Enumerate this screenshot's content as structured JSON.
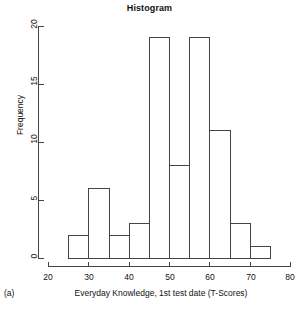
{
  "figure": {
    "panel_label": "(a)",
    "background_color": "#ffffff",
    "line_color": "#444444"
  },
  "chart_data": {
    "type": "bar",
    "title": "Histogram",
    "xlabel": "Everyday Knowledge, 1st test date (T-Scores)",
    "ylabel": "Frequency",
    "bin_width": 5,
    "bin_edges": [
      25,
      30,
      35,
      40,
      45,
      50,
      55,
      60,
      65,
      70,
      75
    ],
    "categories": [
      "25-30",
      "30-35",
      "35-40",
      "40-45",
      "45-50",
      "50-55",
      "55-60",
      "60-65",
      "65-70",
      "70-75"
    ],
    "values": [
      2,
      6,
      2,
      3,
      19,
      8,
      19,
      11,
      3,
      1
    ],
    "xlim": [
      20,
      80
    ],
    "ylim": [
      0,
      20
    ],
    "xticks": [
      20,
      30,
      40,
      50,
      60,
      70,
      80
    ],
    "xtick_labels": [
      "20",
      "30",
      "40",
      "50",
      "60",
      "70",
      "80"
    ],
    "yticks": [
      0,
      5,
      10,
      15,
      20
    ],
    "ytick_labels": [
      "0",
      "5",
      "10",
      "15",
      "20"
    ],
    "grid": false,
    "legend": null,
    "bar_fill": "#ffffff",
    "bar_stroke": "#444444"
  }
}
